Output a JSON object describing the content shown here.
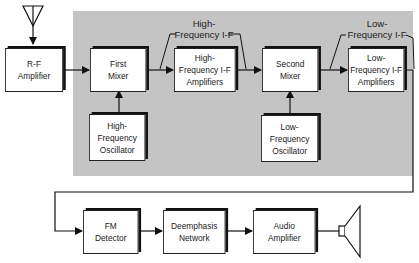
{
  "diagram": {
    "blocks": [
      {
        "id": "rf_amp",
        "label": "R-F\nAmplifier"
      },
      {
        "id": "first_mixer",
        "label": "First\nMixer"
      },
      {
        "id": "hf_if_amp",
        "label": "High-\nFrequency I-F\nAmplifiers"
      },
      {
        "id": "second_mixer",
        "label": "Second\nMixer"
      },
      {
        "id": "lf_if_amp",
        "label": "Low-\nFrequency I-F\nAmplifiers"
      },
      {
        "id": "hf_osc",
        "label": "High-\nFrequency\nOscillator"
      },
      {
        "id": "lf_osc",
        "label": "Low-\nFrequency\nOscillator"
      },
      {
        "id": "fm_detector",
        "label": "FM\nDetector"
      },
      {
        "id": "deemphasis",
        "label": "Deemphasis\nNetwork"
      },
      {
        "id": "audio_amp",
        "label": "Audio\nAmplifier"
      }
    ],
    "annotations": [
      {
        "id": "hf_if_label",
        "label": "High-\nFrequency I-F"
      },
      {
        "id": "lf_if_label",
        "label": "Low-\nFrequency I-F"
      }
    ],
    "icons": [
      "antenna-icon",
      "speaker-icon"
    ],
    "colors": {
      "shaded_region": "#c4c4c4",
      "line": "#222222"
    }
  }
}
